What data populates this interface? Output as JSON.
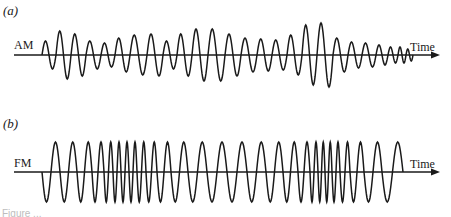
{
  "figure": {
    "panels": [
      {
        "id": "a",
        "label": "(a)",
        "signal_label": "AM",
        "axis_label": "Time",
        "axis_y": 55,
        "axis_x_start": 14,
        "axis_x_end": 440,
        "wave_x_start": 42,
        "label_pos": {
          "x": 3,
          "y": 3
        },
        "signal_label_pos": {
          "x": 14,
          "y": 38
        },
        "axis_label_pos": {
          "x": 410,
          "y": 40
        }
      },
      {
        "id": "b",
        "label": "(b)",
        "signal_label": "FM",
        "axis_label": "Time",
        "axis_y": 172,
        "axis_x_start": 14,
        "axis_x_end": 440,
        "wave_x_start": 42,
        "label_pos": {
          "x": 3,
          "y": 116
        },
        "signal_label_pos": {
          "x": 14,
          "y": 156
        },
        "axis_label_pos": {
          "x": 410,
          "y": 157
        }
      }
    ],
    "caption_fragment": "Figure ..."
  },
  "chart_data": [
    {
      "type": "line",
      "title": "(a) AM — Amplitude Modulation",
      "xlabel": "Time",
      "ylabel": "",
      "description": "Constant-frequency carrier whose amplitude (envelope) varies over time; last few cycles shrink and compress before the axis arrow.",
      "cycles": [
        {
          "x": 42,
          "width": 14,
          "amp": 14
        },
        {
          "x": 56,
          "width": 15,
          "amp": 24
        },
        {
          "x": 71,
          "width": 15,
          "amp": 21
        },
        {
          "x": 86,
          "width": 15,
          "amp": 14
        },
        {
          "x": 101,
          "width": 14,
          "amp": 12
        },
        {
          "x": 115,
          "width": 15,
          "amp": 17
        },
        {
          "x": 130,
          "width": 17,
          "amp": 20
        },
        {
          "x": 147,
          "width": 16,
          "amp": 21
        },
        {
          "x": 163,
          "width": 14,
          "amp": 14
        },
        {
          "x": 177,
          "width": 15,
          "amp": 21
        },
        {
          "x": 192,
          "width": 16,
          "amp": 26
        },
        {
          "x": 208,
          "width": 17,
          "amp": 26
        },
        {
          "x": 225,
          "width": 16,
          "amp": 21
        },
        {
          "x": 241,
          "width": 16,
          "amp": 17
        },
        {
          "x": 257,
          "width": 15,
          "amp": 16
        },
        {
          "x": 272,
          "width": 15,
          "amp": 15
        },
        {
          "x": 287,
          "width": 15,
          "amp": 20
        },
        {
          "x": 302,
          "width": 15,
          "amp": 30
        },
        {
          "x": 317,
          "width": 16,
          "amp": 32
        },
        {
          "x": 333,
          "width": 15,
          "amp": 17
        },
        {
          "x": 348,
          "width": 14,
          "amp": 13
        },
        {
          "x": 362,
          "width": 14,
          "amp": 12
        },
        {
          "x": 376,
          "width": 12,
          "amp": 10
        },
        {
          "x": 388,
          "width": 10,
          "amp": 8
        },
        {
          "x": 398,
          "width": 8,
          "amp": 8
        },
        {
          "x": 406,
          "width": 7,
          "amp": 6
        }
      ]
    },
    {
      "type": "line",
      "title": "(b) FM — Frequency Modulation",
      "xlabel": "Time",
      "ylabel": "",
      "description": "Constant-amplitude carrier whose frequency varies: cycles compress (higher frequency) then expand (lower frequency), twice across the trace. Begins with a downward half-cycle.",
      "amplitude": 30,
      "cycles": [
        {
          "x": 42,
          "width": 18
        },
        {
          "x": 60,
          "width": 17
        },
        {
          "x": 77,
          "width": 15
        },
        {
          "x": 92,
          "width": 12
        },
        {
          "x": 104,
          "width": 9
        },
        {
          "x": 113,
          "width": 8
        },
        {
          "x": 121,
          "width": 8
        },
        {
          "x": 129,
          "width": 8
        },
        {
          "x": 137,
          "width": 9
        },
        {
          "x": 146,
          "width": 11
        },
        {
          "x": 157,
          "width": 14
        },
        {
          "x": 171,
          "width": 17
        },
        {
          "x": 188,
          "width": 19
        },
        {
          "x": 207,
          "width": 20
        },
        {
          "x": 227,
          "width": 20
        },
        {
          "x": 247,
          "width": 19
        },
        {
          "x": 266,
          "width": 17
        },
        {
          "x": 283,
          "width": 15
        },
        {
          "x": 298,
          "width": 12
        },
        {
          "x": 310,
          "width": 8
        },
        {
          "x": 318,
          "width": 7
        },
        {
          "x": 325,
          "width": 7
        },
        {
          "x": 332,
          "width": 8
        },
        {
          "x": 340,
          "width": 10
        },
        {
          "x": 350,
          "width": 14
        },
        {
          "x": 364,
          "width": 18
        },
        {
          "x": 382,
          "width": 21
        }
      ]
    }
  ]
}
